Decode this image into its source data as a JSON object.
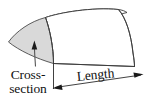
{
  "diagram": {
    "labels": {
      "cross_section_line1": "Cross-",
      "cross_section_line2": "section",
      "length": "Length"
    },
    "colors": {
      "cross_section_fill": "#d9d9d9",
      "outline": "#3a3a3a",
      "body_fill": "#ffffff",
      "text": "#111111",
      "arrow": "#1a1a1a",
      "background": "#ffffff"
    },
    "geometry": {
      "shape": "prism",
      "cross_section_shape": "curved triangular sector",
      "cross_section_points": "8,42 45,17 53,63",
      "length_direction": "left-to-right along bottom edge",
      "dimension_arrows": "double-ended"
    }
  }
}
